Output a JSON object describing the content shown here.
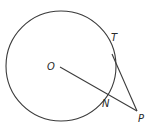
{
  "diagram": {
    "type": "geometry-circle-tangent",
    "colors": {
      "stroke": "#3a3a3a",
      "label": "#2a2a2a",
      "background": "#ffffff"
    },
    "circle": {
      "center": {
        "x": 61,
        "y": 66
      },
      "radius": 55
    },
    "points": {
      "O": {
        "label": "O",
        "x": 61,
        "y": 67
      },
      "T": {
        "label": "T",
        "x": 112,
        "y": 54
      },
      "N": {
        "label": "N",
        "x": 108,
        "y": 96
      },
      "P": {
        "label": "P",
        "x": 137,
        "y": 111
      }
    },
    "segments": [
      {
        "from": "O",
        "to": "P",
        "description": "line from center O through N to P"
      },
      {
        "from": "T",
        "to": "P",
        "description": "tangent from P touching circle at T"
      }
    ],
    "labels": {
      "O": "O",
      "T": "T",
      "N": "N",
      "P": "P"
    }
  }
}
